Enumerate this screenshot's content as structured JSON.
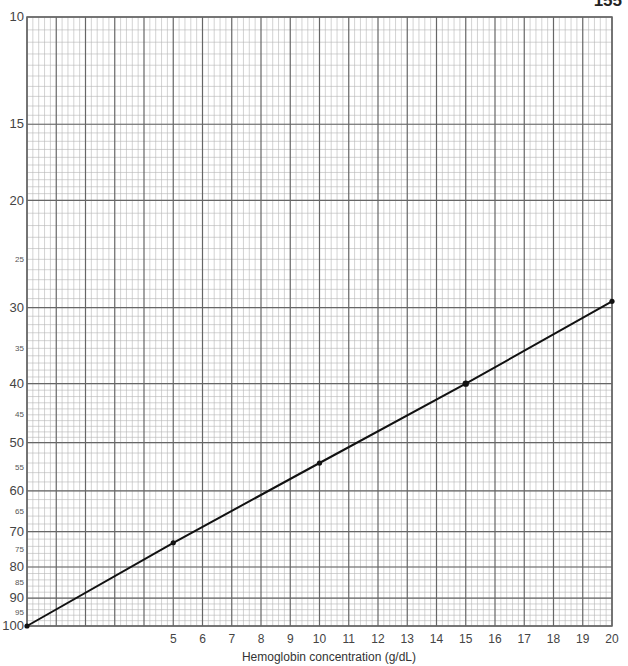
{
  "page_number": "155",
  "chart_data": {
    "type": "line",
    "title": "",
    "xlabel": "Hemoglobin concentration (g/dL)",
    "ylabel": "",
    "x_scale": "linear",
    "y_scale": "log",
    "y_inverted": true,
    "xlim": [
      0,
      20
    ],
    "ylim": [
      10,
      100
    ],
    "grid": true,
    "x_tick_labels": [
      "5",
      "6",
      "7",
      "8",
      "9",
      "10",
      "11",
      "12",
      "13",
      "14",
      "15",
      "16",
      "17",
      "18",
      "19",
      "20"
    ],
    "y_tick_labels": [
      {
        "value": 10,
        "label": "10",
        "style": "major"
      },
      {
        "value": 15,
        "label": "15",
        "style": "major"
      },
      {
        "value": 20,
        "label": "20",
        "style": "major"
      },
      {
        "value": 25,
        "label": "25",
        "style": "minor"
      },
      {
        "value": 30,
        "label": "30",
        "style": "major"
      },
      {
        "value": 35,
        "label": "35",
        "style": "minor"
      },
      {
        "value": 40,
        "label": "40",
        "style": "major"
      },
      {
        "value": 45,
        "label": "45",
        "style": "minor"
      },
      {
        "value": 50,
        "label": "50",
        "style": "major"
      },
      {
        "value": 55,
        "label": "55",
        "style": "minor"
      },
      {
        "value": 60,
        "label": "60",
        "style": "major"
      },
      {
        "value": 65,
        "label": "65",
        "style": "minor"
      },
      {
        "value": 70,
        "label": "70",
        "style": "major"
      },
      {
        "value": 75,
        "label": "75",
        "style": "minor"
      },
      {
        "value": 80,
        "label": "80",
        "style": "major"
      },
      {
        "value": 85,
        "label": "85",
        "style": "minor"
      },
      {
        "value": 90,
        "label": "90",
        "style": "major"
      },
      {
        "value": 95,
        "label": "95",
        "style": "minor"
      },
      {
        "value": 100,
        "label": "100",
        "style": "major"
      }
    ],
    "series": [
      {
        "name": "line",
        "x": [
          0,
          5,
          10,
          15,
          20
        ],
        "values": [
          100,
          73,
          54,
          40,
          29.3
        ],
        "color": "#111111",
        "markers": true
      }
    ]
  },
  "colors": {
    "grid_major": "#666666",
    "grid_minor": "#b5b5b5",
    "line": "#111111"
  }
}
